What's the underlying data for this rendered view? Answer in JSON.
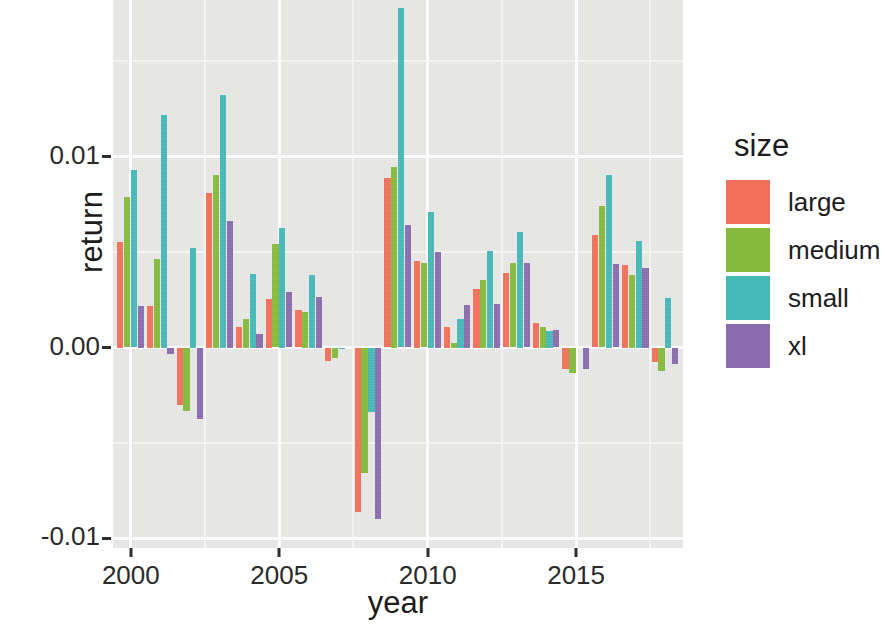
{
  "chart_data": {
    "type": "bar",
    "title": "",
    "xlabel": "year",
    "ylabel": "return",
    "legend_title": "size",
    "legend_position": "right",
    "grid": true,
    "ylim": [
      -0.0105,
      0.0182
    ],
    "xlim": [
      1999.4,
      2018.6
    ],
    "y_ticks": [
      "0.01",
      "0.00",
      "-0.01"
    ],
    "y_tick_values": [
      0.01,
      0.0,
      -0.01
    ],
    "y_minor_ticks": [
      0.015,
      0.005,
      -0.005
    ],
    "x_ticks": [
      "2000",
      "2005",
      "2010",
      "2015"
    ],
    "x_tick_values": [
      2000,
      2005,
      2010,
      2015
    ],
    "x_minor_ticks": [
      2002.5,
      2007.5,
      2012.5,
      2017.5
    ],
    "categories": [
      2000,
      2001,
      2002,
      2003,
      2004,
      2005,
      2006,
      2007,
      2008,
      2009,
      2010,
      2011,
      2012,
      2013,
      2014,
      2015,
      2016,
      2017,
      2018
    ],
    "colors": {
      "large": "#F2705A",
      "medium": "#84BB3B",
      "small": "#45B8B8",
      "xl": "#8A6BAE"
    },
    "series": [
      {
        "name": "large",
        "color": "#F2705A",
        "values": [
          0.00555,
          0.0022,
          -0.003,
          0.0081,
          0.00105,
          0.00255,
          0.00195,
          -0.0007,
          -0.0086,
          0.0089,
          0.00455,
          0.0011,
          0.00305,
          0.0039,
          0.0013,
          -0.0011,
          0.0059,
          0.0043,
          -0.00075
        ]
      },
      {
        "name": "medium",
        "color": "#84BB3B",
        "values": [
          0.0079,
          0.00465,
          -0.0033,
          0.00905,
          0.0015,
          0.0054,
          0.00185,
          -0.00055,
          -0.00655,
          0.00945,
          0.0044,
          0.00025,
          0.00355,
          0.00445,
          0.00105,
          -0.00135,
          0.0074,
          0.0038,
          -0.00125
        ]
      },
      {
        "name": "small",
        "color": "#45B8B8",
        "values": [
          0.0093,
          0.0122,
          0.0052,
          0.0132,
          0.00385,
          0.00625,
          0.0038,
          -0.0001,
          -0.0034,
          0.0178,
          0.0071,
          0.0015,
          0.00505,
          0.00605,
          0.00085,
          0.0,
          0.00905,
          0.0056,
          0.0026
        ]
      },
      {
        "name": "xl",
        "color": "#8A6BAE",
        "values": [
          0.00215,
          -0.00035,
          -0.00375,
          0.0066,
          0.0007,
          0.0029,
          0.00265,
          0.0,
          -0.009,
          0.0064,
          0.005,
          0.00225,
          0.0023,
          0.0044,
          0.0009,
          -0.0011,
          0.00435,
          0.00415,
          -0.00085
        ]
      }
    ]
  },
  "legend": {
    "title": "size",
    "items": [
      {
        "label": "large",
        "color": "#F2705A"
      },
      {
        "label": "medium",
        "color": "#84BB3B"
      },
      {
        "label": "small",
        "color": "#45B8B8"
      },
      {
        "label": "xl",
        "color": "#8A6BAE"
      }
    ]
  }
}
